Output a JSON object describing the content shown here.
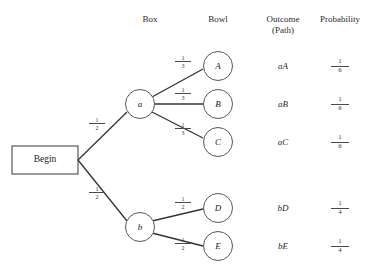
{
  "diagram": {
    "type": "probability-tree",
    "columns": [
      {
        "id": "box",
        "label": "Box",
        "label_line2": "",
        "x_center": 150
      },
      {
        "id": "bowl",
        "label": "Bowl",
        "label_line2": "",
        "x_center": 218
      },
      {
        "id": "outcome",
        "label": "Outcome",
        "label_line2": "(Path)",
        "x_center": 283
      },
      {
        "id": "probability",
        "label": "Probability",
        "label_line2": "",
        "x_center": 340
      }
    ],
    "root": {
      "id": "begin",
      "label": "Begin",
      "shape": "rectangle"
    },
    "box_nodes": [
      {
        "id": "a",
        "label": "a",
        "branch_prob_num": "1",
        "branch_prob_den": "2"
      },
      {
        "id": "b",
        "label": "b",
        "branch_prob_num": "1",
        "branch_prob_den": "2"
      }
    ],
    "bowl_nodes": [
      {
        "id": "A",
        "label": "A",
        "parent": "a",
        "branch_prob_num": "1",
        "branch_prob_den": "3"
      },
      {
        "id": "B",
        "label": "B",
        "parent": "a",
        "branch_prob_num": "1",
        "branch_prob_den": "3"
      },
      {
        "id": "C",
        "label": "C",
        "parent": "a",
        "branch_prob_num": "1",
        "branch_prob_den": "3"
      },
      {
        "id": "D",
        "label": "D",
        "parent": "b",
        "branch_prob_num": "1",
        "branch_prob_den": "2"
      },
      {
        "id": "E",
        "label": "E",
        "parent": "b",
        "branch_prob_num": "1",
        "branch_prob_den": "2"
      }
    ],
    "rows": [
      {
        "outcome": "aA",
        "prob_num": "1",
        "prob_den": "6"
      },
      {
        "outcome": "aB",
        "prob_num": "1",
        "prob_den": "6"
      },
      {
        "outcome": "aC",
        "prob_num": "1",
        "prob_den": "6"
      },
      {
        "outcome": "bD",
        "prob_num": "1",
        "prob_den": "4"
      },
      {
        "outcome": "bE",
        "prob_num": "1",
        "prob_den": "4"
      }
    ],
    "colors": {
      "line": "#333333",
      "node_stroke": "#555555",
      "text": "#222222",
      "background": "#ffffff"
    }
  }
}
